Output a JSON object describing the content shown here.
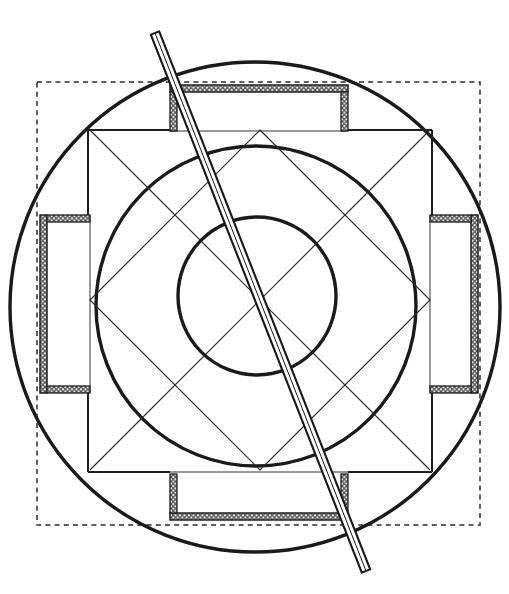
{
  "figure": {
    "title": "Geometric technical line drawing",
    "background_color": "#ffffff",
    "line_color": "#1a1a1a",
    "hatch_color": "#555555",
    "canvas": {
      "width": 509,
      "height": 594
    }
  },
  "chart_data": {
    "type": "diagram",
    "title": "Geometric technical line drawing",
    "xlabel": "",
    "ylabel": "",
    "xlim": [
      0,
      509
    ],
    "ylim": [
      0,
      594
    ],
    "grid": false,
    "legend": "none",
    "center": {
      "x": 255,
      "y": 307
    },
    "elements": [
      {
        "name": "dashed-boundary-square",
        "shape": "rectangle",
        "style": "dashed",
        "x": 37,
        "y": 82,
        "width": 443,
        "height": 443,
        "stroke_width": 1.5,
        "dash_pattern": "5 4.2"
      },
      {
        "name": "outer-circle",
        "shape": "circle",
        "style": "solid-heavy",
        "cx": 255,
        "cy": 307,
        "r": 245,
        "stroke_width": 3.4
      },
      {
        "name": "middle-circle",
        "shape": "circle",
        "style": "solid-heavy",
        "cx": 256,
        "cy": 306,
        "r": 160,
        "stroke_width": 3.4
      },
      {
        "name": "inner-circle",
        "shape": "circle",
        "style": "solid-heavy",
        "cx": 257,
        "cy": 296,
        "r": 79,
        "stroke_width": 3.0
      },
      {
        "name": "cruciform-plate",
        "shape": "cross-polygon",
        "style": "solid-medium-with-hatched-edges",
        "core_square": {
          "x": 88,
          "y": 128,
          "width": 344,
          "height": 344
        },
        "tabs": [
          {
            "id": "top-tab",
            "x": 170,
            "y": 85,
            "width": 178,
            "height": 45,
            "hatched_edges": [
              "top",
              "left",
              "right"
            ]
          },
          {
            "id": "bottom-tab",
            "x": 170,
            "y": 470,
            "width": 178,
            "height": 50,
            "hatched_edges": [
              "bottom",
              "left",
              "right"
            ]
          },
          {
            "id": "left-tab",
            "x": 40,
            "y": 215,
            "width": 50,
            "height": 178,
            "hatched_edges": [
              "left",
              "top",
              "bottom"
            ]
          },
          {
            "id": "right-tab",
            "x": 430,
            "y": 215,
            "width": 48,
            "height": 178,
            "hatched_edges": [
              "right",
              "top",
              "bottom"
            ]
          }
        ]
      },
      {
        "name": "inscribed-rotated-square",
        "shape": "diamond",
        "style": "solid-thin",
        "vertices": [
          {
            "x": 260,
            "y": 130
          },
          {
            "x": 430,
            "y": 300
          },
          {
            "x": 260,
            "y": 470
          },
          {
            "x": 90,
            "y": 300
          }
        ],
        "stroke_width": 1.15
      },
      {
        "name": "diagonal-cross-lines",
        "shape": "lines",
        "style": "solid-thin",
        "lines": [
          {
            "x1": 90,
            "y1": 130,
            "x2": 430,
            "y2": 470
          },
          {
            "x1": 430,
            "y1": 130,
            "x2": 90,
            "y2": 470
          }
        ],
        "stroke_width": 1.15
      },
      {
        "name": "diagonal-rod",
        "shape": "bar",
        "style": "double-line-outline",
        "x1": 155,
        "y1": 33,
        "x2": 366,
        "y2": 571,
        "thickness": 9,
        "stroke_width": 2.1
      }
    ],
    "counts": {
      "circles": 3,
      "tabs": 4,
      "diagonal_lines": 2,
      "rods": 1,
      "dashed_rectangles": 1
    }
  }
}
